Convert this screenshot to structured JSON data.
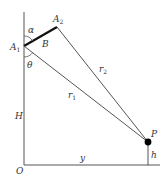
{
  "diagram": {
    "type": "geometry",
    "colors": {
      "line": "#555555",
      "thick": "#111111",
      "point": "#000000"
    },
    "points": {
      "O": {
        "label": "O",
        "x": 24,
        "y": 165
      },
      "A1": {
        "label": "A",
        "sub": "1",
        "x": 24,
        "y": 46
      },
      "A2": {
        "label": "A",
        "sub": "2",
        "x": 57,
        "y": 27
      },
      "P": {
        "label": "P",
        "x": 148,
        "y": 142
      }
    },
    "labels": {
      "alpha": "α",
      "theta": "θ",
      "B": "B",
      "H": "H",
      "y": "y",
      "h": "h",
      "r1": {
        "label": "r",
        "sub": "1"
      },
      "r2": {
        "label": "r",
        "sub": "2"
      }
    }
  }
}
